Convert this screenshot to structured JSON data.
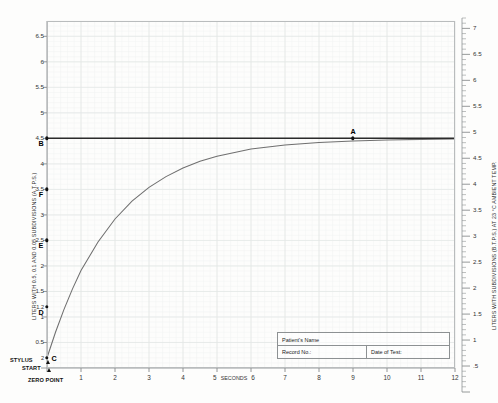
{
  "chart_data": {
    "type": "line",
    "xlabel": "SECONDS",
    "ylabel": "LITERS WITH 0.5, 0.1 AND 0.05 SUBDIVISIONS (A.T.P.S.)",
    "ylabel_right": "LITERS WITH SUBDIVISIONS (B.T.P.S.) AT 23 °C AMBIENT TEMP.",
    "xlim": [
      0,
      12
    ],
    "ylim": [
      0,
      6.8
    ],
    "ylim_right": [
      0,
      7.2
    ],
    "grid": true,
    "legend": "none",
    "x_ticks": [
      "1",
      "2",
      "3",
      "4",
      "5",
      "6",
      "7",
      "8",
      "9",
      "10",
      "11",
      "12"
    ],
    "x_tick_values": [
      1,
      2,
      3,
      4,
      5,
      6,
      7,
      8,
      9,
      10,
      11,
      12
    ],
    "x_center_label": "SECONDS",
    "y_ticks": [
      "6.5",
      "6",
      "5.5",
      "5",
      "4.5",
      "4",
      "3.5",
      "3",
      "2.5",
      "2",
      "1.5",
      "1",
      "0.5"
    ],
    "y_tick_values": [
      6.5,
      6,
      5.5,
      5,
      4.5,
      4,
      3.5,
      3,
      2.5,
      2,
      1.5,
      1,
      0.5
    ],
    "y_extra_ticks": [
      {
        "label": "1.2",
        "value": 1.2
      },
      {
        "label": "2",
        "value": 0.2
      }
    ],
    "y_right_ticks": [
      "7",
      "6.5",
      "6",
      "5.5",
      "5",
      "4.5",
      "4",
      "3.5",
      "3",
      "2.5",
      "2",
      "1.5",
      "1",
      ".5"
    ],
    "y_right_tick_values": [
      7,
      6.5,
      6,
      5.5,
      5,
      4.5,
      4,
      3.5,
      3,
      2.5,
      2,
      1.5,
      1,
      0.5
    ],
    "series": [
      {
        "name": "Vital capacity plateau",
        "type": "horizontal-line",
        "value": 4.5,
        "color": "#2b2b2b",
        "x_from": 0,
        "x_to": 12
      },
      {
        "name": "Expirogram (volume-time curve)",
        "type": "line",
        "color": "#6f6f6f",
        "asymptote": 4.5,
        "start_volume": 0.2,
        "time_constant": 2.0,
        "points": [
          {
            "t": 0.0,
            "v": 0.2
          },
          {
            "t": 0.25,
            "v": 0.7
          },
          {
            "t": 0.5,
            "v": 1.15
          },
          {
            "t": 0.75,
            "v": 1.55
          },
          {
            "t": 1.0,
            "v": 1.91
          },
          {
            "t": 1.5,
            "v": 2.47
          },
          {
            "t": 2.0,
            "v": 2.92
          },
          {
            "t": 2.5,
            "v": 3.27
          },
          {
            "t": 3.0,
            "v": 3.54
          },
          {
            "t": 3.5,
            "v": 3.75
          },
          {
            "t": 4.0,
            "v": 3.92
          },
          {
            "t": 4.5,
            "v": 4.05
          },
          {
            "t": 5.0,
            "v": 4.15
          },
          {
            "t": 6.0,
            "v": 4.29
          },
          {
            "t": 7.0,
            "v": 4.37
          },
          {
            "t": 8.0,
            "v": 4.42
          },
          {
            "t": 9.0,
            "v": 4.45
          },
          {
            "t": 10.0,
            "v": 4.47
          },
          {
            "t": 11.0,
            "v": 4.48
          },
          {
            "t": 12.0,
            "v": 4.49
          }
        ]
      }
    ],
    "annotations": [
      {
        "id": "A",
        "label": "A",
        "t": 9.0,
        "v": 4.5,
        "note": "plateau / total vital capacity reached"
      },
      {
        "id": "B",
        "label": "B",
        "t": 0.0,
        "v": 4.5,
        "note": "vital capacity level on volume axis"
      },
      {
        "id": "C",
        "label": "C",
        "t": 0.0,
        "v": 0.2,
        "note": "start of forced expiration"
      },
      {
        "id": "D",
        "label": "D",
        "t": 0.0,
        "v": 1.2,
        "note": "axis marker"
      },
      {
        "id": "E",
        "label": "E",
        "t": 0.0,
        "v": 2.5,
        "note": "axis marker"
      },
      {
        "id": "F",
        "label": "F",
        "t": 0.0,
        "v": 3.5,
        "note": "axis marker"
      }
    ]
  },
  "labels": {
    "stylus": "STYLUS",
    "start": "START",
    "zero_point": "ZERO POINT"
  },
  "form": {
    "patient_name": "Patient's Name",
    "record_no": "Record No.:",
    "date_of_test": "Date of Test:"
  },
  "colors": {
    "curve": "#6f6f6f",
    "plateau_line": "#2b2b2b",
    "grid_major": "#e3e7e6",
    "grid_minor": "#f0f3f2",
    "frame": "#b9bcbd",
    "text": "#232323",
    "paper": "#fdfdfc"
  }
}
